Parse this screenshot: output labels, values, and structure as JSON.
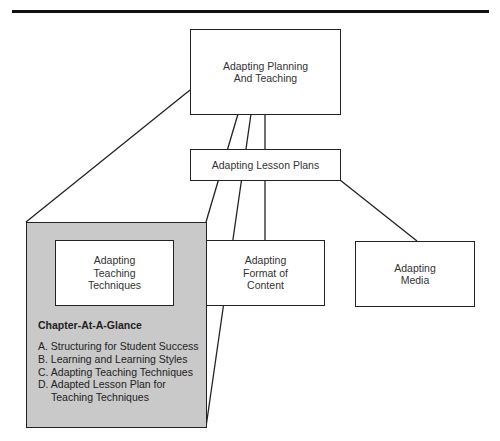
{
  "diagram": {
    "top": {
      "line1": "Adapting Planning",
      "line2": "And Teaching"
    },
    "middle": {
      "label": "Adapting Lesson Plans"
    },
    "children": [
      {
        "line1": "Adapting",
        "line2": "Teaching",
        "line3": "Techniques"
      },
      {
        "line1": "Adapting",
        "line2": "Format of",
        "line3": "Content"
      },
      {
        "line1": "Adapting",
        "line2": "Media"
      }
    ],
    "glance": {
      "title": "Chapter-At-A-Glance",
      "items": [
        {
          "text": "A.  Structuring for Student Success"
        },
        {
          "text": "B.  Learning and Learning Styles"
        },
        {
          "text": "C.  Adapting Teaching Techniques"
        },
        {
          "text": "D. Adapted Lesson Plan for",
          "cont": "Teaching Techniques"
        }
      ]
    },
    "colors": {
      "line": "#222222",
      "highlight_fill": "#c9c9c9",
      "box_fill": "#ffffff"
    }
  }
}
